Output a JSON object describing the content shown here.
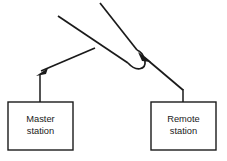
{
  "diagram": {
    "background_color": "#ffffff",
    "line_color": "#1a1a1a",
    "boxes": [
      {
        "id": "master-station",
        "label_line1": "Master",
        "label_line2": "station",
        "x": 8,
        "y": 102,
        "width": 65,
        "height": 48
      },
      {
        "id": "remote-station",
        "label_line1": "Remote",
        "label_line2": "station",
        "x": 151,
        "y": 102,
        "width": 65,
        "height": 48
      }
    ],
    "arrows": [
      {
        "id": "arrow-to-master",
        "direction": "down-left",
        "tip_x": 38,
        "tip_y": 74
      },
      {
        "id": "arrow-to-reflection",
        "direction": "up-left",
        "tip_x": 140,
        "tip_y": 54
      }
    ],
    "paths": [
      {
        "id": "incoming-upper-left-ray",
        "description": "diagonal ray from upper left descending to the right"
      },
      {
        "id": "incoming-top-ray",
        "description": "diagonal ray from top descending to the hairpin"
      },
      {
        "id": "hairpin-reflection-curve",
        "description": "U-turn reflection curve at right of diagram"
      },
      {
        "id": "master-vertical-connector",
        "description": "vertical line from arrowhead down to master station box"
      },
      {
        "id": "remote-vertical-connector",
        "description": "vertical line from remote station box top up to the slanted path"
      }
    ]
  }
}
